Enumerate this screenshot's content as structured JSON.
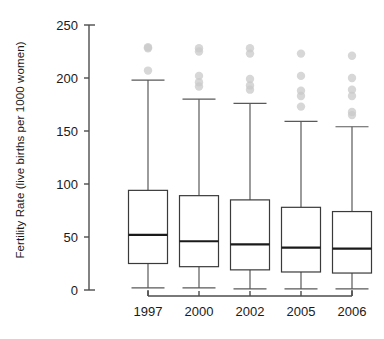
{
  "chart_data": {
    "type": "box",
    "title": "",
    "xlabel": "",
    "ylabel": "Fertility Rate (live births per 1000 women)",
    "ylim": [
      0,
      250
    ],
    "yticks": [
      0,
      50,
      100,
      150,
      200,
      250
    ],
    "ytick_labels": [
      "0",
      "50",
      "100",
      "150",
      "200",
      "250"
    ],
    "grid": false,
    "legend": "none",
    "categories": [
      "1997",
      "2000",
      "2002",
      "2005",
      "2006"
    ],
    "boxes": [
      {
        "category": "1997",
        "whisker_low": 2,
        "q1": 25,
        "median": 52,
        "q3": 94,
        "whisker_high": 198,
        "outliers": [
          229,
          228,
          207
        ]
      },
      {
        "category": "2000",
        "whisker_low": 2,
        "q1": 22,
        "median": 46,
        "q3": 89,
        "whisker_high": 180,
        "outliers": [
          228,
          225,
          202,
          196,
          192
        ]
      },
      {
        "category": "2002",
        "whisker_low": 1,
        "q1": 19,
        "median": 43,
        "q3": 85,
        "whisker_high": 176,
        "outliers": [
          228,
          223,
          199,
          193,
          189
        ]
      },
      {
        "category": "2005",
        "whisker_low": 1,
        "q1": 17,
        "median": 40,
        "q3": 78,
        "whisker_high": 159,
        "outliers": [
          223,
          202,
          188,
          183,
          173
        ]
      },
      {
        "category": "2006",
        "whisker_low": 1,
        "q1": 16,
        "median": 39,
        "q3": 74,
        "whisker_high": 154,
        "outliers": [
          221,
          200,
          189,
          183,
          168,
          165
        ]
      }
    ],
    "colors": {
      "axis": "#4d4d4d",
      "box_edge": "#3a3a3a",
      "median": "#1a1a1a",
      "whisker": "#595959",
      "outlier": "#c9c9c9",
      "background": "#ffffff",
      "text": "#1a1a1a"
    }
  }
}
